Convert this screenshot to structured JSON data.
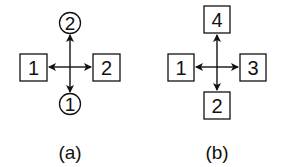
{
  "diagrams": [
    {
      "caption": "(a)",
      "top": {
        "shape": "circle",
        "label": "2"
      },
      "left": {
        "shape": "square",
        "label": "1"
      },
      "right": {
        "shape": "square",
        "label": "2"
      },
      "bottom": {
        "shape": "circle",
        "label": "1"
      }
    },
    {
      "caption": "(b)",
      "top": {
        "shape": "square",
        "label": "4"
      },
      "left": {
        "shape": "square",
        "label": "1"
      },
      "right": {
        "shape": "square",
        "label": "3"
      },
      "bottom": {
        "shape": "square",
        "label": "2"
      }
    }
  ],
  "colors": {
    "stroke": "#111111",
    "background": "#ffffff"
  }
}
